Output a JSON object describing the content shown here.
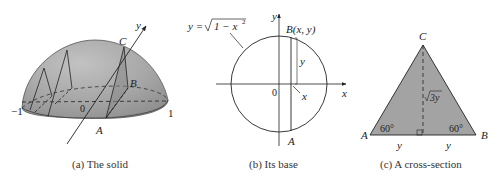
{
  "figure": {
    "panels": [
      {
        "id": "a",
        "caption": "(a) The solid",
        "labels": {
          "neg_one": "−1",
          "one": "1",
          "origin": "0",
          "y_axis": "y",
          "A": "A",
          "B": "B",
          "C": "C"
        }
      },
      {
        "id": "b",
        "caption": "(b) Its base",
        "labels": {
          "formula_lhs": "y = ",
          "formula_rad": "1 − x",
          "formula_exp": "2",
          "y_axis": "y",
          "x_axis": "x",
          "origin": "0",
          "point_B": "B(x, y)",
          "point_A": "A",
          "segment_y": "y",
          "segment_x": "x"
        }
      },
      {
        "id": "c",
        "caption": "(c) A cross-section",
        "labels": {
          "C": "C",
          "A": "A",
          "B": "B",
          "angle_left": "60°",
          "angle_right": "60°",
          "height": "3y",
          "base_left": "y",
          "base_right": "y"
        }
      }
    ],
    "colors": {
      "solid_fill": "#a8a8a8",
      "solid_shadow": "#8c8c8c",
      "triangle_fill": "#a3a3a3",
      "line": "#222222"
    }
  }
}
